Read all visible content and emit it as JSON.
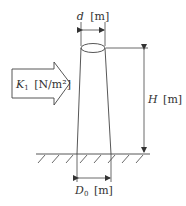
{
  "diagram": {
    "labels": {
      "top_diameter": {
        "symbol": "d",
        "unit": "[m]"
      },
      "wind_pressure": {
        "symbol": "K",
        "subscript": "1",
        "unit": "[N/m²]"
      },
      "height": {
        "symbol": "H",
        "unit": "[m]"
      },
      "base_diameter": {
        "symbol": "D",
        "subscript": "0",
        "unit": "[m]"
      }
    },
    "colors": {
      "line": "#444444",
      "text": "#333333",
      "background": "#ffffff"
    }
  }
}
